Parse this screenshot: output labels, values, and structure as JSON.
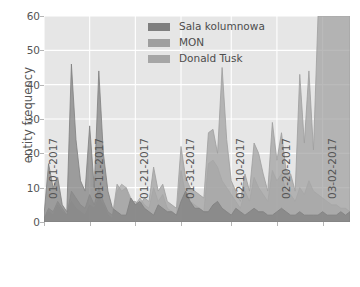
{
  "chart_data": {
    "type": "area",
    "title": "",
    "subtitle": "",
    "xlabel": "",
    "ylabel": "entity frequency",
    "ylim": [
      0,
      60
    ],
    "yticks": [
      0,
      10,
      20,
      30,
      40,
      50,
      60
    ],
    "xtick_labels": [
      "01-01-2017",
      "01-11-2017",
      "01-21-2017",
      "01-31-2017",
      "02-10-2017",
      "02-20-2017",
      "03-02-2017"
    ],
    "xtick_indices": [
      0,
      10,
      20,
      30,
      41,
      51,
      61
    ],
    "grid": true,
    "legend_position": "upper center",
    "stacked": false,
    "x_start": "01-01-2017",
    "x_end": "03-09-2017",
    "n_points": 68,
    "series": [
      {
        "name": "Sala kolumnowa",
        "color": "#7f7f7f",
        "values": [
          2,
          17,
          10,
          13,
          5,
          3,
          46,
          24,
          12,
          9,
          28,
          10,
          44,
          20,
          9,
          4,
          3,
          2,
          2,
          7,
          5,
          6,
          4,
          3,
          2,
          5,
          4,
          3,
          3,
          2,
          6,
          9,
          6,
          4,
          4,
          3,
          3,
          5,
          6,
          4,
          3,
          2,
          4,
          3,
          2,
          3,
          4,
          3,
          3,
          2,
          2,
          3,
          4,
          3,
          2,
          2,
          3,
          2,
          2,
          2,
          2,
          3,
          2,
          2,
          2,
          3,
          2,
          3
        ]
      },
      {
        "name": "MON",
        "color": "#9f9f9f",
        "values": [
          1,
          4,
          3,
          6,
          4,
          2,
          9,
          7,
          5,
          4,
          8,
          5,
          10,
          6,
          3,
          2,
          11,
          9,
          10,
          6,
          6,
          5,
          7,
          6,
          16,
          9,
          11,
          6,
          5,
          4,
          22,
          13,
          10,
          9,
          8,
          7,
          26,
          27,
          20,
          45,
          24,
          12,
          9,
          6,
          14,
          9,
          23,
          20,
          14,
          9,
          29,
          18,
          26,
          15,
          14,
          9,
          43,
          23,
          44,
          21,
          60,
          60,
          60,
          60,
          60,
          60,
          60,
          60
        ]
      },
      {
        "name": "Donald Tusk",
        "color": "#a6a6a6",
        "values": [
          1,
          3,
          2,
          5,
          3,
          2,
          6,
          4,
          3,
          2,
          5,
          4,
          7,
          5,
          2,
          1,
          9,
          11,
          10,
          7,
          5,
          7,
          5,
          4,
          10,
          6,
          8,
          4,
          3,
          2,
          15,
          8,
          6,
          5,
          4,
          3,
          17,
          18,
          16,
          12,
          10,
          8,
          6,
          4,
          9,
          6,
          13,
          10,
          8,
          6,
          15,
          12,
          14,
          9,
          8,
          6,
          10,
          8,
          12,
          9,
          8,
          7,
          6,
          5,
          5,
          4,
          4,
          3
        ]
      }
    ],
    "legend_entries": [
      {
        "label": "Sala kolumnowa",
        "color": "#7f7f7f"
      },
      {
        "label": "MON",
        "color": "#9f9f9f"
      },
      {
        "label": "Donald Tusk",
        "color": "#a6a6a6"
      }
    ],
    "colors": {
      "plot_background": "#e6e6e6",
      "figure_background": "#ffffff",
      "gridline": "#ffffff",
      "tick_label": "#555555",
      "axis_label": "#555555"
    }
  }
}
